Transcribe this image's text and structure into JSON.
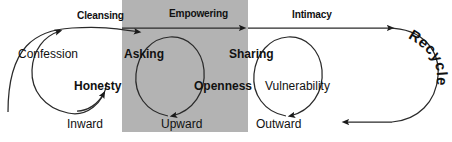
{
  "diagram": {
    "shaded_panel": {
      "label": "empowering-panel",
      "color": "#b3b3b3"
    },
    "stroke_color": "#222222",
    "background": "#ffffff",
    "phases": [
      {
        "id": "cleansing",
        "label": "Cleansing"
      },
      {
        "id": "empowering",
        "label": "Empowering"
      },
      {
        "id": "intimacy",
        "label": "Intimacy"
      }
    ],
    "loops": [
      {
        "id": "loop-confession",
        "top_label": "Confession",
        "bottom_label": "Honesty",
        "direction_label": "Inward"
      },
      {
        "id": "loop-asking",
        "top_label": "Asking",
        "bottom_label": "Openness",
        "direction_label": "Upward"
      },
      {
        "id": "loop-sharing",
        "top_label": "Sharing",
        "bottom_label": "Vulnerability",
        "direction_label": "Outward"
      }
    ],
    "return_arc": {
      "id": "recycle",
      "label": "Recycle"
    }
  }
}
